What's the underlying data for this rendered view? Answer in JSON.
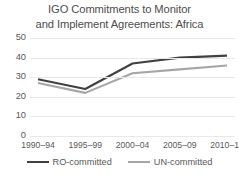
{
  "chart_data": {
    "type": "line",
    "title": "IGO Commitments to Monitor and Implement Agreements: Africa",
    "title_lines": [
      "IGO Commitments to Monitor",
      "and Implement Agreements: Africa"
    ],
    "xlabel": "",
    "ylabel": "",
    "categories": [
      "1990–94",
      "1995–99",
      "2000–04",
      "2005–09",
      "2010–14"
    ],
    "ylim": [
      0,
      50
    ],
    "ytick_values": [
      0,
      10,
      20,
      30,
      40,
      50
    ],
    "ytick_labels": [
      "0",
      "10",
      "20",
      "30",
      "40",
      "50"
    ],
    "grid": true,
    "grid_axis": "y",
    "legend_position": "bottom",
    "series": [
      {
        "name": "RO-committed",
        "color": "#404040",
        "values": [
          29,
          24,
          37,
          40,
          41
        ]
      },
      {
        "name": "UN-committed",
        "color": "#a6a6a6",
        "values": [
          27,
          22,
          32,
          34,
          36
        ]
      }
    ]
  },
  "colors": {
    "background": "#ffffff",
    "title_text": "#4d4d4d",
    "axis_text": "#595959",
    "gridline": "#e8e8e8",
    "ro_committed": "#404040",
    "un_committed": "#a6a6a6"
  }
}
